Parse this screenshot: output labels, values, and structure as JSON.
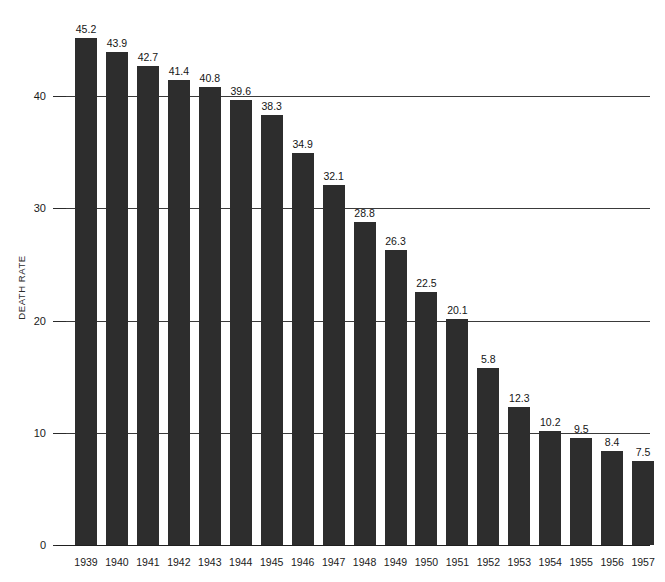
{
  "chart_data": {
    "type": "bar",
    "title": "",
    "subtitle": "",
    "xlabel": "",
    "ylabel": "DEATH RATE",
    "categories": [
      "1939",
      "1940",
      "1941",
      "1942",
      "1943",
      "1944",
      "1945",
      "1946",
      "1947",
      "1948",
      "1949",
      "1950",
      "1951",
      "1952",
      "1953",
      "1954",
      "1955",
      "1956",
      "1957"
    ],
    "values": [
      45.2,
      43.9,
      42.7,
      41.4,
      40.8,
      39.6,
      38.3,
      34.9,
      32.1,
      28.8,
      26.3,
      22.5,
      20.1,
      15.8,
      12.3,
      10.2,
      9.5,
      8.4,
      7.5
    ],
    "data_labels": [
      "45.2",
      "43.9",
      "42.7",
      "41.4",
      "40.8",
      "39.6",
      "38.3",
      "34.9",
      "32.1",
      "28.8",
      "26.3",
      "22.5",
      "20.1",
      "5.8",
      "12.3",
      "10.2",
      "9.5",
      "8.4",
      "7.5"
    ],
    "ylim": [
      0,
      46
    ],
    "yticks": [
      0,
      10,
      20,
      30,
      40
    ],
    "ytick_labels": [
      "0",
      "10",
      "20",
      "30",
      "40"
    ],
    "gridlines": [
      10,
      20,
      30,
      40
    ],
    "grid": true,
    "legend": null,
    "legend_position": "none",
    "bar_color": "#2d2d2d",
    "background_color": "#ffffff",
    "axis_color": "#1f1f1f",
    "grid_color": "#3a3a3a",
    "annotations": []
  },
  "axis": {
    "y_title": "DEATH RATE"
  }
}
